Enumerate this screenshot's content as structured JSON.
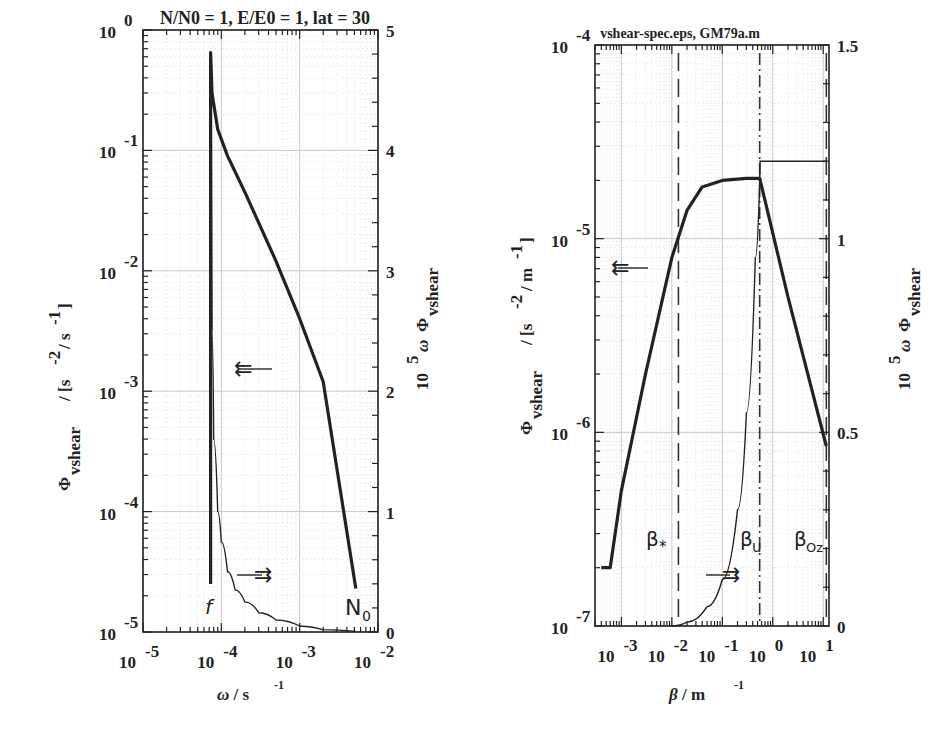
{
  "chart_data": [
    {
      "type": "line",
      "title": "N/N0 = 1, E/E0 = 1, lat = 30",
      "xlabel": "ω / s^-1",
      "ylabel": "Φ_vshear / [s^-2 / s^-1]",
      "ylabel_right": "10^5 ω Φ_vshear",
      "xscale": "log",
      "yscale": "log",
      "xlim": [
        1e-05,
        0.01
      ],
      "ylim": [
        1e-05,
        1
      ],
      "ylim_right": [
        0,
        5
      ],
      "x_ticks": [
        "10^-5",
        "10^-4",
        "10^-3",
        "10^-2"
      ],
      "y_ticks": [
        "10^-5",
        "10^-4",
        "10^-3",
        "10^-2",
        "10^-1",
        "10^0"
      ],
      "y_ticks_right": [
        "0",
        "1",
        "2",
        "3",
        "4",
        "5"
      ],
      "grid": true,
      "annotations": [
        {
          "text": "f",
          "x": 7.3e-05
        },
        {
          "text": "N0",
          "x": 0.0052
        },
        {
          "text": "⇇ (left axis)",
          "series": "Φ_vshear"
        },
        {
          "text": "⇉ (right axis)",
          "series": "10^5 ω Φ_vshear"
        }
      ],
      "series": [
        {
          "name": "Φ_vshear (left axis, log)",
          "x": [
            7.3e-05,
            7.3e-05,
            7.6e-05,
            9e-05,
            0.00012,
            0.0002,
            0.0005,
            0.001,
            0.002,
            0.0052
          ],
          "y": [
            2.5e-05,
            0.65,
            0.3,
            0.15,
            0.09,
            0.045,
            0.012,
            0.004,
            0.0012,
            2.3e-05
          ]
        },
        {
          "name": "10^5 ω Φ_vshear (right axis, linear)",
          "x": [
            7.4e-05,
            7.6e-05,
            8e-05,
            9e-05,
            0.0001,
            0.00012,
            0.00015,
            0.0002,
            0.0003,
            0.0005,
            0.001,
            0.002,
            0.0052
          ],
          "y": [
            4.8,
            2.5,
            1.6,
            1.0,
            0.75,
            0.5,
            0.35,
            0.25,
            0.16,
            0.1,
            0.05,
            0.02,
            0.005
          ]
        }
      ]
    },
    {
      "type": "line",
      "title": "vshear-spec.eps, GM79a.m",
      "xlabel": "β / m^-1",
      "ylabel": "Φ_vshear / [s^-2 / m^-1]",
      "ylabel_right": "10^5 ω Φ_vshear",
      "xscale": "log",
      "yscale": "log",
      "xlim": [
        0.0003,
        13
      ],
      "ylim": [
        1e-07,
        0.0001
      ],
      "ylim_right": [
        0,
        1.5
      ],
      "x_ticks": [
        "10^-3",
        "10^-2",
        "10^-1",
        "10^0",
        "10^1"
      ],
      "y_ticks": [
        "10^-7",
        "10^-6",
        "10^-5",
        "10^-4"
      ],
      "y_ticks_right": [
        "0",
        "0.5",
        "1",
        "1.5"
      ],
      "grid": true,
      "vlines": [
        {
          "label": "β*",
          "x": 0.0135,
          "style": "dashed"
        },
        {
          "label": "βu",
          "x": 0.55,
          "style": "dash-dot"
        },
        {
          "label": "βOz",
          "x": 11.5,
          "style": "dashed"
        }
      ],
      "annotations": [
        {
          "text": "⇇ (left axis)",
          "series": "Φ_vshear"
        },
        {
          "text": "⇉ (right axis)",
          "series": "cumulative"
        }
      ],
      "series": [
        {
          "name": "Φ_vshear (left axis, log)",
          "x": [
            0.0004,
            0.0006,
            0.001,
            0.003,
            0.01,
            0.02,
            0.04,
            0.1,
            0.3,
            0.55,
            2,
            11.5
          ],
          "y": [
            2e-07,
            2e-07,
            5e-07,
            2e-06,
            8e-06,
            1.4e-05,
            1.85e-05,
            2e-05,
            2.05e-05,
            2.05e-05,
            5e-06,
            8.5e-07
          ]
        },
        {
          "name": "cumulative (right axis, linear)",
          "x": [
            0.01,
            0.02,
            0.05,
            0.1,
            0.2,
            0.3,
            0.45,
            0.55,
            0.56,
            11.5
          ],
          "y": [
            0,
            0.01,
            0.05,
            0.12,
            0.3,
            0.55,
            0.95,
            1.15,
            1.2,
            1.2
          ]
        }
      ]
    }
  ],
  "left_plot": {
    "title": "N/N0 = 1, E/E0 = 1, lat = 30",
    "xlabel_main": "ω / s",
    "xlabel_sup": "-1",
    "ylabel_phi": "Φ",
    "ylabel_sub": "vshear",
    "ylabel_units": "/ [s",
    "ylabel_units_sup1": "-2",
    "ylabel_units_mid": "/ s",
    "ylabel_units_sup2": "-1",
    "ylabel_units_end": "]",
    "ylabel_right_10": "10",
    "ylabel_right_5": "5",
    "ylabel_right_omega": "ω",
    "ylabel_right_phi": "Φ",
    "ylabel_right_sub": "vshear",
    "xticks": [
      {
        "base": "10",
        "exp": "-5"
      },
      {
        "base": "10",
        "exp": "-4"
      },
      {
        "base": "10",
        "exp": "-3"
      },
      {
        "base": "10",
        "exp": "-2"
      }
    ],
    "yticks": [
      {
        "base": "10",
        "exp": "-5"
      },
      {
        "base": "10",
        "exp": "-4"
      },
      {
        "base": "10",
        "exp": "-3"
      },
      {
        "base": "10",
        "exp": "-2"
      },
      {
        "base": "10",
        "exp": "-1"
      },
      {
        "base": "10",
        "exp": "0"
      }
    ],
    "yticks_right": [
      "0",
      "1",
      "2",
      "3",
      "4",
      "5"
    ],
    "label_f": "f",
    "label_N": "N",
    "label_N_sub": "0"
  },
  "right_plot": {
    "title": "vshear-spec.eps, GM79a.m",
    "xlabel_main": "β / m",
    "xlabel_sup": "-1",
    "ylabel_phi": "Φ",
    "ylabel_sub": "vshear",
    "ylabel_units": "/ [s",
    "ylabel_units_sup1": "-2",
    "ylabel_units_mid": "/ m",
    "ylabel_units_sup2": "-1",
    "ylabel_units_end": "]",
    "ylabel_right_10": "10",
    "ylabel_right_5": "5",
    "ylabel_right_omega": "ω",
    "ylabel_right_phi": "Φ",
    "ylabel_right_sub": "vshear",
    "xticks": [
      {
        "base": "10",
        "exp": "-3"
      },
      {
        "base": "10",
        "exp": "-2"
      },
      {
        "base": "10",
        "exp": "-1"
      },
      {
        "base": "10",
        "exp": "0"
      },
      {
        "base": "10",
        "exp": "1"
      }
    ],
    "yticks": [
      {
        "base": "10",
        "exp": "-7"
      },
      {
        "base": "10",
        "exp": "-6"
      },
      {
        "base": "10",
        "exp": "-5"
      },
      {
        "base": "10",
        "exp": "-4"
      }
    ],
    "yticks_right": [
      "0",
      "0.5",
      "1",
      "1.5"
    ],
    "label_bstar": "β",
    "label_bstar_sub": "*",
    "label_bu": "β",
    "label_bu_sub": "u",
    "label_boz": "β",
    "label_boz_sub": "Oz"
  },
  "arrows": {
    "left": "⇇",
    "right": "⇉"
  }
}
